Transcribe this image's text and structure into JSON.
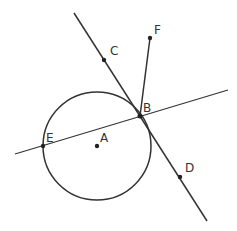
{
  "diagram": {
    "colors": {
      "stroke": "#333333",
      "background": "#ffffff"
    },
    "circle": {
      "center": "A",
      "cx": 97,
      "cy": 146,
      "r": 54
    },
    "points": {
      "A": {
        "label": "A",
        "x": 97,
        "y": 146
      },
      "B": {
        "label": "B",
        "x": 140,
        "y": 116
      },
      "C": {
        "label": "C",
        "x": 104,
        "y": 60
      },
      "D": {
        "label": "D",
        "x": 180,
        "y": 177
      },
      "E": {
        "label": "E",
        "x": 43,
        "y": 146
      },
      "F": {
        "label": "F",
        "x": 150,
        "y": 38
      }
    },
    "lines": [
      {
        "name": "line-CD",
        "through": [
          "C",
          "B",
          "D"
        ],
        "x1": 74,
        "y1": 13,
        "x2": 207,
        "y2": 221
      },
      {
        "name": "line-EB",
        "through": [
          "E",
          "B"
        ],
        "x1": 15,
        "y1": 154,
        "x2": 228,
        "y2": 90
      }
    ],
    "segments": [
      {
        "name": "segment-BF",
        "from": "B",
        "to": "F"
      }
    ]
  }
}
